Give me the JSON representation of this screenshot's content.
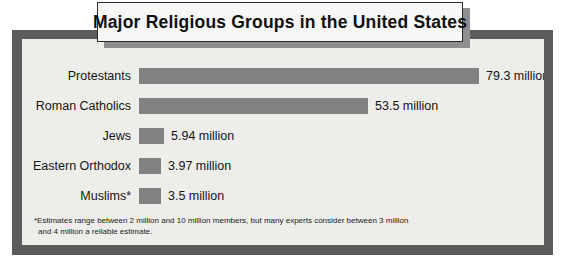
{
  "title": "Major Religious Groups in the United States",
  "colors": {
    "bar": "#828282",
    "frame": "#5c5c5c",
    "surface": "#ededea",
    "plaque": "#f7f7f5",
    "text": "#151515"
  },
  "footnote": {
    "line1": "*Estimates range between 2 million and 10 million members, but many experts consider between 3 million",
    "line2": "and 4 million a reliable estimate."
  },
  "chart_data": {
    "type": "bar",
    "orientation": "horizontal",
    "title": "Major Religious Groups in the United States",
    "xlabel": "",
    "ylabel": "",
    "unit": "million members",
    "grid": false,
    "legend": null,
    "xlim": [
      0,
      85
    ],
    "categories": [
      "Protestants",
      "Roman Catholics",
      "Jews",
      "Eastern Orthodox",
      "Muslims*"
    ],
    "values": [
      79.3,
      53.5,
      5.94,
      3.97,
      3.5
    ],
    "value_labels": [
      "79.3 million",
      "53.5 million",
      "5.94 million",
      "3.97 million",
      "3.5 million"
    ],
    "annotations": [
      "*Estimates range between 2 million and 10 million members, but many experts consider between 3 million and 4 million a reliable estimate."
    ]
  }
}
